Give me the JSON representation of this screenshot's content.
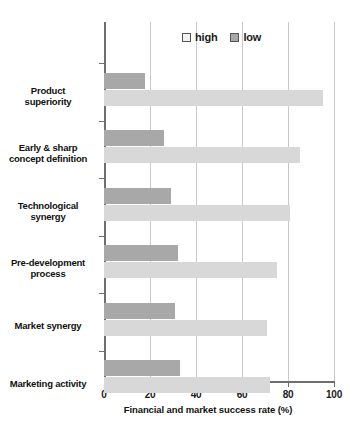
{
  "chart_data": {
    "type": "bar",
    "orientation": "horizontal",
    "title": "",
    "xlabel": "Financial and market success rate (%)",
    "ylabel": "",
    "xlim": [
      0,
      100
    ],
    "xticks": [
      0,
      20,
      40,
      60,
      80,
      100
    ],
    "grid": true,
    "legend_position": "top-center",
    "categories": [
      "Product superiority",
      "Early & sharp concept definition",
      "Technological synergy",
      "Pre-development process",
      "Market synergy",
      "Marketing activity"
    ],
    "series": [
      {
        "name": "high",
        "color": "#d8d8d8",
        "values": [
          95,
          85,
          81,
          75,
          71,
          72
        ]
      },
      {
        "name": "low",
        "color": "#a8a8a8",
        "values": [
          18,
          26,
          29,
          32,
          31,
          33
        ]
      }
    ]
  },
  "legend": {
    "items": [
      {
        "label": "high",
        "swatch": "high"
      },
      {
        "label": "low",
        "swatch": "low"
      }
    ]
  },
  "axis": {
    "x_title": "Financial and market success rate (%)",
    "x_tick_labels": [
      "0",
      "20",
      "40",
      "60",
      "80",
      "100"
    ]
  },
  "category_labels": [
    {
      "line1": "Product",
      "line2": "superiority"
    },
    {
      "line1": "Early & sharp",
      "line2": "concept definition"
    },
    {
      "line1": "Technological",
      "line2": "synergy"
    },
    {
      "line1": "Pre-development",
      "line2": "process"
    },
    {
      "line1": "Market synergy",
      "line2": ""
    },
    {
      "line1": "Marketing activity",
      "line2": ""
    }
  ],
  "colors": {
    "high_bar": "#d8d8d8",
    "low_bar": "#a8a8a8",
    "axis": "#6e6e6e",
    "grid": "#c9c9c9",
    "text": "#111111"
  }
}
